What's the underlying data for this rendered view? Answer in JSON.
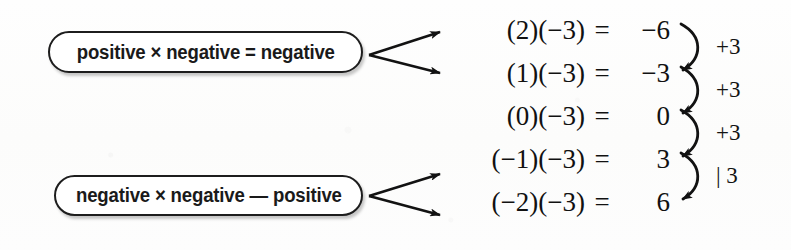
{
  "diagram": {
    "ink_color": "#1a1a1a",
    "paper_color": "#fdfdfc",
    "rules": [
      {
        "text": "positive × negative = negative"
      },
      {
        "text": "negative × negative — positive"
      }
    ],
    "equations": [
      {
        "lhs": "(2)(−3)",
        "sign": "=",
        "result": "−6"
      },
      {
        "lhs": "(1)(−3)",
        "sign": "=",
        "result": "−3"
      },
      {
        "lhs": "(0)(−3)",
        "sign": "=",
        "result": "0"
      },
      {
        "lhs": "(−1)(−3)",
        "sign": "=",
        "result": "3"
      },
      {
        "lhs": "(−2)(−3)",
        "sign": "=",
        "result": "6"
      }
    ],
    "steps": [
      {
        "label": "+3"
      },
      {
        "label": "+3"
      },
      {
        "label": "+3"
      },
      {
        "label": "| 3"
      }
    ]
  }
}
